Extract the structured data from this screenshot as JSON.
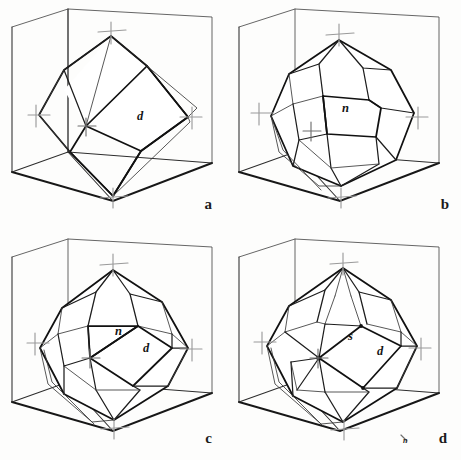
{
  "figure": {
    "background_color": "#fdfdfc",
    "line_color": "#171717",
    "axis_mark_color": "#9a9a9a",
    "panel_count": 4
  },
  "panels": [
    {
      "id": "a",
      "label": "a",
      "form_name": "rhombic dodecahedron",
      "face_labels": [
        {
          "symbol": "d",
          "x": 137,
          "y": 120
        }
      ],
      "axis_marks": [
        {
          "name": "vertical-axis-top",
          "x": 111,
          "y": 30
        },
        {
          "name": "vertical-axis-bottom",
          "x": 113,
          "y": 196
        },
        {
          "name": "horizontal-axis-left",
          "x": 39,
          "y": 115
        },
        {
          "name": "horizontal-axis-right",
          "x": 190,
          "y": 117
        },
        {
          "name": "axis-center-front",
          "x": 86,
          "y": 126
        }
      ]
    },
    {
      "id": "b",
      "label": "b",
      "form_name": "pyritohedron (pentagonal dodecahedron)",
      "face_labels": [
        {
          "symbol": "n",
          "x": 111,
          "y": 112
        }
      ],
      "axis_marks": [
        {
          "name": "vertical-axis-top",
          "x": 108,
          "y": 33
        },
        {
          "name": "vertical-axis-bottom",
          "x": 110,
          "y": 196
        },
        {
          "name": "horizontal-axis-left",
          "x": 31,
          "y": 113
        },
        {
          "name": "horizontal-axis-right",
          "x": 185,
          "y": 117
        },
        {
          "name": "axis-center-front",
          "x": 80,
          "y": 131
        }
      ]
    },
    {
      "id": "c",
      "label": "c",
      "form_name": "pyritohedron and rhombic dodecahedron combination",
      "face_labels": [
        {
          "symbol": "n",
          "x": 115,
          "y": 105
        },
        {
          "symbol": "d",
          "x": 143,
          "y": 122
        }
      ],
      "axis_marks": [
        {
          "name": "vertical-axis-top",
          "x": 113,
          "y": 33
        },
        {
          "name": "vertical-axis-bottom",
          "x": 114,
          "y": 197
        },
        {
          "name": "horizontal-axis-left",
          "x": 38,
          "y": 113
        },
        {
          "name": "horizontal-axis-right",
          "x": 190,
          "y": 119
        },
        {
          "name": "axis-center-front",
          "x": 90,
          "y": 128
        }
      ]
    },
    {
      "id": "d",
      "label": "d",
      "form_name": "diploid and rhombic dodecahedron combination",
      "face_labels": [
        {
          "symbol": "s",
          "x": 117,
          "y": 110
        },
        {
          "symbol": "d",
          "x": 146,
          "y": 125
        }
      ],
      "edge_labels": [
        {
          "symbol": "n",
          "x": 172,
          "y": 213
        }
      ],
      "axis_marks": [
        {
          "name": "vertical-axis-top",
          "x": 112,
          "y": 32
        },
        {
          "name": "vertical-axis-bottom",
          "x": 113,
          "y": 198
        },
        {
          "name": "horizontal-axis-left",
          "x": 34,
          "y": 112
        },
        {
          "name": "horizontal-axis-right",
          "x": 188,
          "y": 118
        },
        {
          "name": "axis-center-front",
          "x": 87,
          "y": 128
        }
      ]
    }
  ]
}
